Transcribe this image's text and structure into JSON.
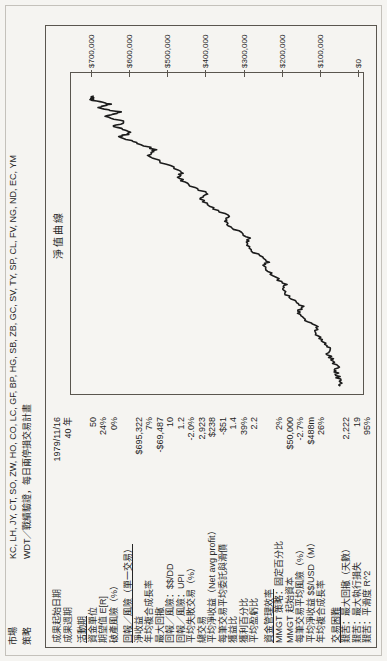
{
  "header": {
    "market_label": "市場",
    "market_value": "KC, LH, JY, CT, SO, ZW, HO, CO, LC, GF, BP, HG, SB, ZB, GC, SV, TY, SP, CL, FV, NG, ND, EC, YM",
    "strategy_label": "策略",
    "strategy_value": "WDT／戰績驗證，每日兩停損交易計畫"
  },
  "table": {
    "sections": [
      {
        "title": "",
        "rows": [
          {
            "label": "成果起始日期",
            "value": "1979/11/16"
          },
          {
            "label": "成果週期",
            "value": "40 年"
          }
        ]
      },
      {
        "title": "活動期",
        "rows": [
          {
            "label": "資金單位",
            "value": "50"
          },
          {
            "label": "期望值 E[R]",
            "value": "24%"
          },
          {
            "label": "破產風險（%）",
            "value": "0%"
          }
        ]
      },
      {
        "title": "回報／風險（單一交易）",
        "rows": [
          {
            "label": "淨收益",
            "value": "$695,322"
          },
          {
            "label": "年均複合成長率",
            "value": "7%"
          },
          {
            "label": "最大回撤",
            "value": "-$69,487"
          },
          {
            "label": "回報／風險：$$/DD",
            "value": "10"
          },
          {
            "label": "回報／風險：UPI",
            "value": "1.2"
          },
          {
            "label": "平均失敗交易（%）",
            "value": "-2.0%"
          },
          {
            "label": "總交易",
            "value": "2,923"
          },
          {
            "label": "平均淨收益（Net avg profit）",
            "value": "$238"
          },
          {
            "label": "每筆交易平均委託與滑價",
            "value": "-$51"
          },
          {
            "label": "獲益比",
            "value": "1.4"
          },
          {
            "label": "獲利百分比",
            "value": "39%"
          },
          {
            "label": "平均盈虧比",
            "value": "2.2"
          }
        ]
      },
      {
        "title": "資金管理效率",
        "rows": [
          {
            "label": "MMGT 策略：固定百分比",
            "value": "2%"
          },
          {
            "label": "MMGT 起始資本",
            "value": "$50,000"
          },
          {
            "label": "每筆交易平均風險（%）",
            "value": "-2.7%"
          },
          {
            "label": "平均淨收益 $$/USD（M）",
            "value": "$488m"
          },
          {
            "label": "年均複合成長率",
            "value": "26%"
          }
        ]
      },
      {
        "title": "交易困難",
        "rows": [
          {
            "label": "艱苦：最大回撤（天數）",
            "value": "2,222"
          },
          {
            "label": "艱苦：最大執行損失",
            "value": "19"
          },
          {
            "label": "艱苦：平滑度 R^2",
            "value": "95%"
          }
        ]
      }
    ]
  },
  "chart_data": {
    "type": "line",
    "title": "淨值曲線",
    "xlabel": "",
    "ylabel": "",
    "axis_side": "right",
    "grid": false,
    "ylim": [
      0,
      700000
    ],
    "ytick_labels": [
      "$700,000",
      "$600,000",
      "$500,000",
      "$400,000",
      "$300,000",
      "$200,000",
      "$100,000",
      "$0"
    ],
    "ytick_values": [
      700000,
      600000,
      500000,
      400000,
      300000,
      200000,
      100000,
      0
    ],
    "x_start_date": "1979/11/16",
    "x_span_years": 40,
    "series": [
      {
        "name": "淨值",
        "color": "#1c1c1c",
        "points": [
          [
            0.0,
            50000
          ],
          [
            0.02,
            52000
          ],
          [
            0.045,
            60000
          ],
          [
            0.065,
            57000
          ],
          [
            0.09,
            70000
          ],
          [
            0.115,
            82000
          ],
          [
            0.135,
            78000
          ],
          [
            0.16,
            100000
          ],
          [
            0.185,
            115000
          ],
          [
            0.205,
            110000
          ],
          [
            0.23,
            142000
          ],
          [
            0.255,
            158000
          ],
          [
            0.275,
            150000
          ],
          [
            0.3,
            175000
          ],
          [
            0.33,
            200000
          ],
          [
            0.35,
            193000
          ],
          [
            0.38,
            225000
          ],
          [
            0.41,
            248000
          ],
          [
            0.43,
            240000
          ],
          [
            0.46,
            275000
          ],
          [
            0.49,
            298000
          ],
          [
            0.51,
            290000
          ],
          [
            0.54,
            325000
          ],
          [
            0.565,
            350000
          ],
          [
            0.585,
            342000
          ],
          [
            0.615,
            385000
          ],
          [
            0.645,
            415000
          ],
          [
            0.665,
            400000
          ],
          [
            0.695,
            448000
          ],
          [
            0.72,
            475000
          ],
          [
            0.74,
            462000
          ],
          [
            0.77,
            515000
          ],
          [
            0.795,
            550000
          ],
          [
            0.815,
            535000
          ],
          [
            0.84,
            585000
          ],
          [
            0.86,
            625000
          ],
          [
            0.875,
            595000
          ],
          [
            0.895,
            645000
          ],
          [
            0.91,
            612000
          ],
          [
            0.93,
            662000
          ],
          [
            0.945,
            628000
          ],
          [
            0.96,
            688000
          ],
          [
            0.972,
            655000
          ],
          [
            0.985,
            700000
          ],
          [
            1.0,
            695322
          ]
        ]
      }
    ]
  }
}
